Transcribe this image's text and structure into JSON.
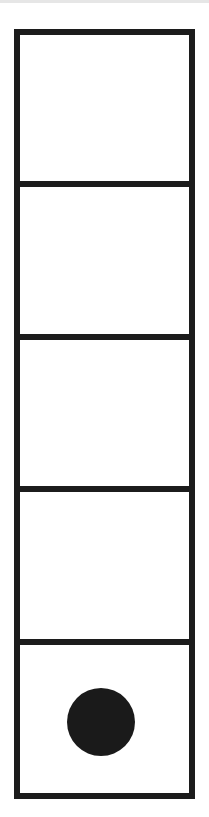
{
  "board": {
    "columns": 1,
    "rows": 5,
    "border_color": "#1c1c1c",
    "background_color": "#ffffff",
    "cells": [
      {
        "row": 0,
        "piece": null
      },
      {
        "row": 1,
        "piece": null
      },
      {
        "row": 2,
        "piece": null
      },
      {
        "row": 3,
        "piece": null
      },
      {
        "row": 4,
        "piece": {
          "shape": "circle",
          "color": "#1a1a1a"
        }
      }
    ]
  },
  "top_band_color": "#e6e6e6"
}
